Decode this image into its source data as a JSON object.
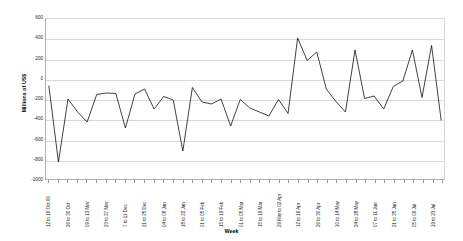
{
  "chart_data": {
    "type": "line",
    "title": "",
    "xlabel": "Week",
    "ylabel": "Millions of US$",
    "ylim": [
      -1000,
      600
    ],
    "ytick_step": 200,
    "yticks": [
      600,
      400,
      200,
      0,
      -200,
      -400,
      -600,
      -800,
      -1000
    ],
    "ytick_labels": [
      "600",
      "400",
      "200",
      "0",
      "-200",
      "-400",
      "-600",
      "-800",
      "-1000"
    ],
    "grid": true,
    "legend": false,
    "series_color": "#000000",
    "plot_background": "#ffffff",
    "gridline_color": "#d9d9d9",
    "categories": [
      "12 to 16 Oct 09",
      "19 to 23 Oct",
      "26 to 30 Oct",
      "02 to 06 Nov",
      "09 to 13 Nov",
      "16 to 20 Nov",
      "23 to 27 Nov",
      "30 Nov to 4 Dec",
      "7 to 11 Dec",
      "14 to 18 Dec",
      "21 to 25 Dec",
      "28 Dec to 01 Jan",
      "04 to 08 Jan",
      "11 to 15 Jan",
      "18 to 22 Jan",
      "25 to 29 Jan",
      "01 to 05 Feb",
      "08 to 12 Feb",
      "15 to 19 Feb",
      "22 to 26 Feb",
      "01 to 05 Mar",
      "08 to 12 Mar",
      "15 to 19 Mar",
      "22 to 26 Mar",
      "29 Mar to 02 Apr",
      "05 to 09 Apr",
      "12 to 16 Apr",
      "19 to 23 Apr",
      "26 to 30 Apr",
      "03 to 07 May",
      "10 to 14 May",
      "17 to 21 May",
      "24 to 28 May",
      "31 May to 04 Jun",
      "07 to 11 Jun",
      "14 to 18 Jun",
      "21 to 25 Jun",
      "28 Jun to 02 Jul",
      "05 to 09 Jul",
      "12 to 16 Jul",
      "19 to 23 Jul",
      "26 to 30 Jul"
    ],
    "labeled_categories": [
      "12 to 16 Oct 09",
      "26 to 30 Oct",
      "09 to 13 Nov",
      "23 to 27 Nov",
      "7 to 11 Dec",
      "21 to 25 Dec",
      "04 to 08 Jan",
      "18 to 22 Jan",
      "01 to 05 Feb",
      "15 to 19 Feb",
      "01 to 05 Mar",
      "15 to 19 Mar",
      "29 Mar to 02 Apr",
      "12 to 16 Apr",
      "26 to 30 Apr",
      "10 to 14 May",
      "24 to 28 May",
      "07 to 11 Jun",
      "21 to 25 Jun",
      "05 to 09 Jul",
      "19 to 23 Jul"
    ],
    "values": [
      -70,
      -830,
      -200,
      -330,
      -430,
      -155,
      -140,
      -145,
      -490,
      -150,
      -100,
      -300,
      -175,
      -210,
      -720,
      -85,
      -230,
      -250,
      -200,
      -470,
      -205,
      -290,
      -330,
      -370,
      -205,
      -345,
      410,
      185,
      270,
      -100,
      -225,
      -330,
      290,
      -195,
      -170,
      -300,
      -75,
      -20,
      290,
      -185,
      335,
      -410
    ]
  }
}
